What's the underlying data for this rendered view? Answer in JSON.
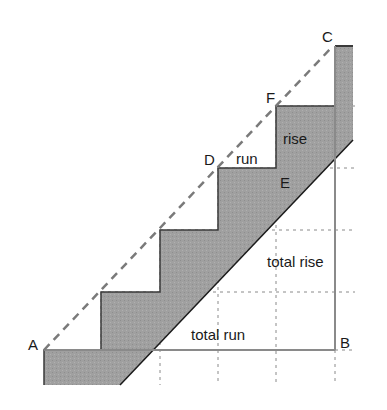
{
  "diagram": {
    "points": {
      "A": "A",
      "B": "B",
      "C": "C",
      "D": "D",
      "E": "E",
      "F": "F"
    },
    "labels": {
      "rise": "rise",
      "run": "run",
      "total_rise": "total rise",
      "total_run": "total run"
    },
    "colors": {
      "fill": "#9a9a9a",
      "outline": "#3a3a3a",
      "dashed": "#7a7a7a",
      "guide": "#8a8a8a"
    }
  }
}
